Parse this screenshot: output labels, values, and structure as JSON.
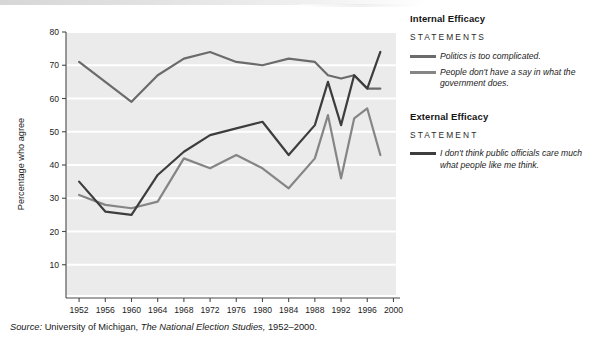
{
  "chart_data": {
    "type": "line",
    "title": "",
    "xlabel": "",
    "ylabel": "Percentage who agree",
    "xlim": [
      1950,
      2001
    ],
    "ylim": [
      0,
      80
    ],
    "yticks": [
      10,
      20,
      30,
      40,
      50,
      60,
      70,
      80
    ],
    "xticks": [
      1952,
      1956,
      1960,
      1964,
      1968,
      1972,
      1976,
      1980,
      1984,
      1988,
      1992,
      1996,
      2000
    ],
    "grid": "horizontal-white-gridlines",
    "plot_background": "#ebebeb",
    "legend_position": "right",
    "series": [
      {
        "name": "Politics is too complicated.",
        "group": "Internal Efficacy",
        "color": "#6b6b6b",
        "x": [
          1952,
          1956,
          1960,
          1964,
          1968,
          1972,
          1976,
          1980,
          1984,
          1988,
          1990,
          1992,
          1994,
          1996,
          1998
        ],
        "values": [
          71,
          65,
          59,
          67,
          72,
          74,
          71,
          70,
          72,
          71,
          67,
          66,
          67,
          63,
          63
        ]
      },
      {
        "name": "People don't have a say in what the government does.",
        "group": "Internal Efficacy",
        "color": "#858585",
        "x": [
          1952,
          1956,
          1960,
          1964,
          1968,
          1972,
          1976,
          1980,
          1984,
          1988,
          1990,
          1992,
          1994,
          1996,
          1998
        ],
        "values": [
          31,
          28,
          27,
          29,
          42,
          39,
          43,
          39,
          33,
          42,
          55,
          36,
          54,
          57,
          43
        ]
      },
      {
        "name": "I don't think public officials care much what people like me think.",
        "group": "External Efficacy",
        "color": "#3d3d3d",
        "x": [
          1952,
          1956,
          1960,
          1964,
          1968,
          1972,
          1976,
          1980,
          1984,
          1988,
          1990,
          1992,
          1994,
          1996,
          1998
        ],
        "values": [
          35,
          26,
          25,
          37,
          44,
          49,
          51,
          53,
          43,
          52,
          65,
          52,
          67,
          63,
          74
        ]
      }
    ]
  },
  "axis": {
    "ylabel": "Percentage who agree"
  },
  "legend": {
    "internal": {
      "title": "Internal Efficacy",
      "subtitle": "STATEMENTS",
      "entries": [
        {
          "label": "Politics is too complicated.",
          "color": "#6b6b6b"
        },
        {
          "label": "People don't have a say in what the government does.",
          "color": "#858585"
        }
      ]
    },
    "external": {
      "title": "External Efficacy",
      "subtitle": "STATEMENT",
      "entries": [
        {
          "label": "I don't think public officials care much what people like me think.",
          "color": "#3d3d3d"
        }
      ]
    }
  },
  "source": {
    "prefix": "Source:",
    "institution": "University of Michigan,",
    "publication": "The National Election Studies,",
    "years": "1952–2000."
  }
}
